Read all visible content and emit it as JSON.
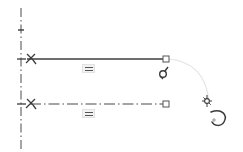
{
  "canvas": {
    "label": "Sketch Canvas",
    "background_color": "#ffffff",
    "width": 243,
    "height": 152
  },
  "colors": {
    "geometry": "#3c3c3c",
    "construction": "#4a4a4a",
    "centerline": "#4a4a4a",
    "marker_stroke": "#555555",
    "arc_guide": "#e0e0e0",
    "constraint_fill": "#f2f2f2",
    "constraint_stroke": "#e2e2e2",
    "cursor": "#3a3a3a"
  },
  "centerline": {
    "name": "vertical-centerline",
    "style": "dash-dot",
    "x": 21,
    "y_start": 8,
    "y_end": 150,
    "ticks": [
      {
        "name": "axis-tick-top",
        "y": 30
      },
      {
        "name": "axis-tick-upper-line",
        "y": 59
      },
      {
        "name": "axis-tick-lower-line",
        "y": 104
      }
    ]
  },
  "entities": [
    {
      "name": "upper-solid-line",
      "type": "line",
      "style": "solid",
      "x1": 27,
      "y1": 59,
      "x2": 166,
      "y2": 59,
      "start_symbol": "fix-constraint-icon",
      "end_marker": "square-endpoint"
    },
    {
      "name": "lower-construction-line",
      "type": "line",
      "style": "dash-dot",
      "x1": 27,
      "y1": 104,
      "x2": 166,
      "y2": 104,
      "start_symbol": "fix-constraint-icon",
      "end_marker": "square-endpoint"
    }
  ],
  "constraints": [
    {
      "name": "equal-constraint-upper",
      "symbol": "equals-icon",
      "label": "=",
      "x": 88,
      "y": 68
    },
    {
      "name": "equal-constraint-lower",
      "symbol": "equals-icon",
      "label": "=",
      "x": 88,
      "y": 113
    }
  ],
  "guide_arc": {
    "name": "drag-guide-arc",
    "style": "thin-light-curve",
    "from_x": 168,
    "from_y": 59,
    "to_x": 209,
    "to_y": 103
  },
  "cursors": [
    {
      "name": "rotate-handle-cursor",
      "symbol": "rotate-grip-icon",
      "x": 164,
      "y": 72
    },
    {
      "name": "drag-cursor",
      "symbol": "cursor-arrow-with-curl-icon",
      "x": 206,
      "y": 98
    }
  ],
  "endpoints": [
    {
      "name": "endpoint-upper-right",
      "shape": "square",
      "x": 166,
      "y": 59
    },
    {
      "name": "endpoint-lower-right",
      "shape": "square",
      "x": 166,
      "y": 104
    }
  ],
  "accessibility": {
    "canvas_title": "Parametric sketch with two horizontal lines and equal constraints",
    "upper_line_label": "Upper solid profile line",
    "lower_line_label": "Lower construction line",
    "centerline_label": "Vertical construction centerline"
  }
}
